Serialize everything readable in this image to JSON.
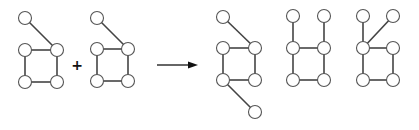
{
  "diagram": {
    "node_radius": 6.5,
    "colors": {
      "edge": "#444444",
      "node_stroke": "#555555",
      "node_fill": "#ffffff",
      "operator": "#111111"
    },
    "operator": {
      "symbol": "+",
      "x": 77,
      "y": 65
    },
    "arrow": {
      "x1": 157,
      "y1": 65,
      "x2": 198,
      "y2": 65
    },
    "graphs": [
      {
        "name": "input-graph-1",
        "nodes": [
          [
            25,
            18
          ],
          [
            25,
            50
          ],
          [
            57,
            50
          ],
          [
            25,
            82
          ],
          [
            57,
            82
          ]
        ],
        "edges": [
          [
            0,
            2
          ],
          [
            1,
            2
          ],
          [
            1,
            3
          ],
          [
            2,
            4
          ],
          [
            3,
            4
          ]
        ]
      },
      {
        "name": "input-graph-2",
        "nodes": [
          [
            97,
            18
          ],
          [
            97,
            49
          ],
          [
            128,
            49
          ],
          [
            97,
            81
          ],
          [
            128,
            81
          ]
        ],
        "edges": [
          [
            0,
            2
          ],
          [
            1,
            2
          ],
          [
            1,
            3
          ],
          [
            2,
            4
          ],
          [
            3,
            4
          ]
        ]
      },
      {
        "name": "result-graph-1",
        "nodes": [
          [
            223,
            17
          ],
          [
            223,
            48
          ],
          [
            255,
            48
          ],
          [
            223,
            80
          ],
          [
            255,
            80
          ],
          [
            255,
            112
          ]
        ],
        "edges": [
          [
            0,
            2
          ],
          [
            1,
            2
          ],
          [
            1,
            3
          ],
          [
            2,
            4
          ],
          [
            3,
            4
          ],
          [
            3,
            5
          ]
        ]
      },
      {
        "name": "result-graph-2",
        "nodes": [
          [
            293,
            16
          ],
          [
            324,
            16
          ],
          [
            293,
            48
          ],
          [
            324,
            48
          ],
          [
            293,
            80
          ],
          [
            324,
            80
          ]
        ],
        "edges": [
          [
            0,
            2
          ],
          [
            1,
            3
          ],
          [
            2,
            3
          ],
          [
            2,
            4
          ],
          [
            3,
            5
          ],
          [
            4,
            5
          ]
        ]
      },
      {
        "name": "result-graph-3",
        "nodes": [
          [
            363,
            16
          ],
          [
            393,
            16
          ],
          [
            363,
            48
          ],
          [
            393,
            48
          ],
          [
            363,
            80
          ],
          [
            393,
            80
          ]
        ],
        "edges": [
          [
            0,
            2
          ],
          [
            1,
            2
          ],
          [
            2,
            3
          ],
          [
            2,
            4
          ],
          [
            3,
            5
          ],
          [
            4,
            5
          ]
        ]
      }
    ]
  }
}
